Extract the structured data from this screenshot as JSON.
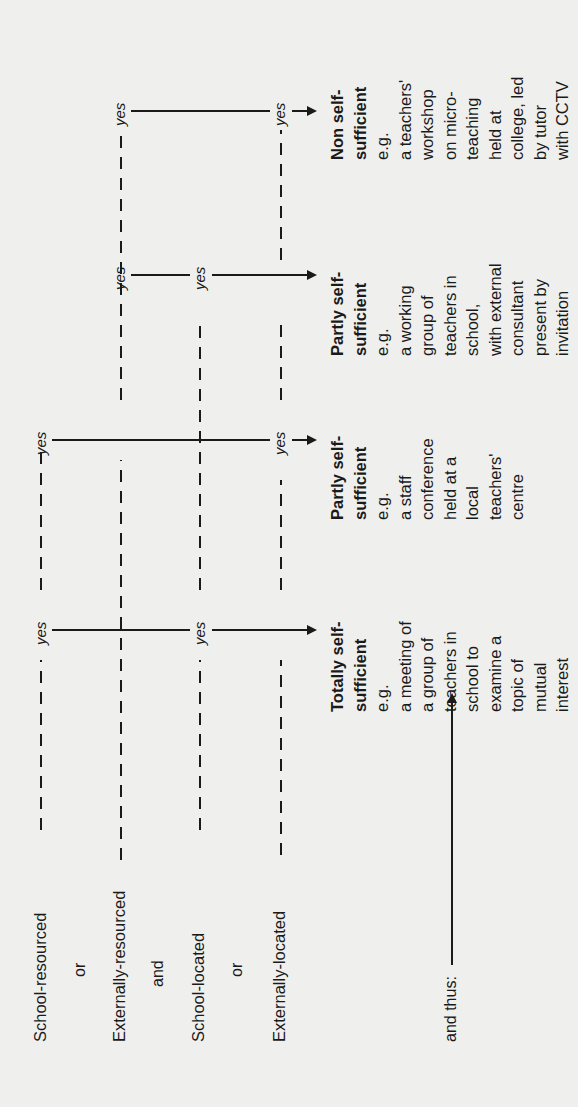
{
  "conditions": {
    "school_resourced": "School-resourced",
    "or_1": "or",
    "externally_resourced": "Externally-resourced",
    "and": "and",
    "school_located": "School-located",
    "or_2": "or",
    "externally_located": "Externally-located",
    "and_thus": "and thus:"
  },
  "yes_label": "yes",
  "outcomes": [
    {
      "title_lines": [
        "Totally self-",
        "sufficient"
      ],
      "eg": "e.g.",
      "example_lines": [
        "a meeting of",
        "a group of",
        "teachers in",
        "school to",
        "examine a",
        "topic of",
        "mutual",
        "interest"
      ]
    },
    {
      "title_lines": [
        "Partly self-",
        "sufficient"
      ],
      "eg": "e.g.",
      "example_lines": [
        "a staff",
        "conference",
        "held at a",
        "local",
        "teachers'",
        "centre"
      ]
    },
    {
      "title_lines": [
        "Partly self-",
        "sufficient"
      ],
      "eg": "e.g.",
      "example_lines": [
        "a working",
        "group of",
        "teachers in",
        "school,",
        "with external",
        "consultant",
        "present by",
        "invitation"
      ]
    },
    {
      "title_lines": [
        "Non self-",
        "sufficient"
      ],
      "eg": "e.g.",
      "example_lines": [
        "a teachers'",
        "workshop",
        "on micro-",
        "teaching",
        "held at",
        "college, led",
        "by tutor",
        "with CCTV"
      ]
    }
  ],
  "colors": {
    "background": "#efefed",
    "ink": "#1a1a1a"
  }
}
